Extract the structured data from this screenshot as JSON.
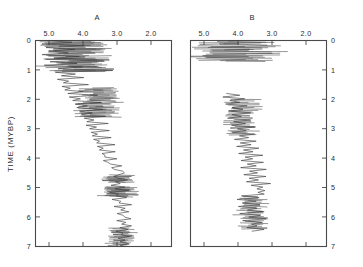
{
  "figure": {
    "background": "#ffffff",
    "ink_color": "#3a3a3a",
    "axis_color": "#4a4a4a"
  },
  "axis": {
    "y_title": "TIME (MYBP)",
    "y_ticks": [
      "0",
      "1",
      "2",
      "3",
      "4",
      "5",
      "6",
      "7"
    ],
    "y_values": [
      0,
      1,
      2,
      3,
      4,
      5,
      6,
      7
    ],
    "x_ticks": [
      "5.0",
      "4.0",
      "3.0",
      "2.0"
    ],
    "x_values": [
      5.0,
      4.0,
      3.0,
      2.0
    ]
  },
  "panels": [
    {
      "id": "A",
      "title": "A",
      "y_axis_side": "left"
    },
    {
      "id": "B",
      "title": "B",
      "y_axis_side": "right"
    }
  ],
  "chart_data": {
    "type": "line",
    "title": "",
    "xlabel": "",
    "ylabel": "TIME (MYBP)",
    "xlim": [
      5.3,
      1.75
    ],
    "ylim": [
      0,
      7
    ],
    "x_tick_labels": [
      "5.0",
      "4.0",
      "3.0",
      "2.0"
    ],
    "x_tick_values": [
      5.0,
      4.0,
      3.0,
      2.0
    ],
    "y_tick_labels": [
      "0",
      "1",
      "2",
      "3",
      "4",
      "5",
      "6",
      "7"
    ],
    "y_tick_values": [
      0,
      1,
      2,
      3,
      4,
      5,
      6,
      7
    ],
    "x_axis_position": "top",
    "x_axis_direction": "reversed",
    "grid": false,
    "legend": "none",
    "series": [
      {
        "name": "A",
        "panel": "A",
        "orientation": "vertical",
        "y_label": "TIME (MYBP)",
        "x_label": "value",
        "description": "High-frequency oscillating trace spanning 0 to 7 MYBP; noisy band near 4.6-5.1 at top, drifting toward 3.0-3.3 by 3.5-7 MYBP.",
        "y": [
          0.0,
          0.06,
          0.12,
          0.18,
          0.24,
          0.3,
          0.36,
          0.42,
          0.48,
          0.54,
          0.6,
          0.66,
          0.72,
          0.78,
          0.84,
          0.9,
          0.96,
          1.02,
          1.08,
          1.14,
          1.2,
          1.26,
          1.32,
          1.38,
          1.44,
          1.5,
          1.56,
          1.62,
          1.68,
          1.74,
          1.8,
          1.86,
          1.92,
          1.98,
          2.04,
          2.1,
          2.16,
          2.22,
          2.28,
          2.34,
          2.4,
          2.46,
          2.52,
          2.58,
          2.64,
          2.7,
          2.76,
          2.82,
          2.88,
          2.94,
          3.0,
          3.06,
          3.12,
          3.18,
          3.24,
          3.3,
          3.36,
          3.42,
          3.48,
          3.54,
          3.6,
          3.66,
          3.72,
          3.78,
          3.84,
          3.9,
          3.96,
          4.02,
          4.08,
          4.14,
          4.2,
          4.26,
          4.32,
          4.38,
          4.44,
          4.5,
          4.56,
          4.62,
          4.68,
          4.74,
          4.8,
          4.86,
          4.92,
          4.98,
          5.04,
          5.1,
          5.16,
          5.22,
          5.28,
          5.34,
          5.4,
          5.46,
          5.52,
          5.58,
          5.64,
          5.7,
          5.76,
          5.82,
          5.88,
          5.94,
          6.0,
          6.06,
          6.12,
          6.18,
          6.24,
          6.3,
          6.36,
          6.42,
          6.48,
          6.54,
          6.6,
          6.66,
          6.72,
          6.78,
          6.84,
          6.9,
          6.96,
          7.0
        ],
        "x": [
          5.05,
          4.35,
          5.1,
          4.05,
          5.0,
          4.25,
          4.95,
          4.45,
          5.15,
          4.15,
          4.85,
          3.35,
          4.9,
          4.2,
          5.05,
          4.1,
          4.7,
          3.25,
          4.8,
          4.3,
          4.65,
          4.0,
          4.75,
          4.4,
          4.55,
          3.95,
          4.6,
          4.35,
          4.5,
          4.05,
          4.45,
          3.7,
          4.4,
          4.1,
          4.3,
          3.6,
          4.25,
          3.95,
          4.2,
          3.5,
          4.15,
          3.85,
          4.1,
          3.45,
          4.05,
          3.75,
          4.0,
          3.4,
          3.95,
          3.7,
          3.9,
          3.35,
          3.85,
          3.65,
          3.8,
          3.3,
          3.75,
          3.6,
          3.7,
          3.25,
          3.65,
          3.55,
          3.6,
          3.2,
          3.55,
          3.5,
          3.52,
          3.15,
          3.5,
          3.45,
          3.3,
          3.05,
          3.35,
          3.2,
          3.05,
          2.95,
          3.1,
          3.25,
          3.15,
          2.9,
          3.2,
          3.05,
          3.3,
          3.0,
          3.25,
          2.85,
          3.35,
          3.1,
          3.2,
          2.95,
          3.3,
          3.05,
          3.15,
          2.8,
          3.25,
          3.0,
          3.1,
          2.9,
          3.2,
          3.05,
          3.0,
          2.85,
          3.15,
          2.95,
          3.05,
          2.8,
          3.1,
          2.9,
          3.2,
          3.0,
          3.05,
          2.85,
          3.15,
          2.95,
          3.1,
          2.9,
          3.05,
          3.0
        ]
      },
      {
        "name": "B-upper",
        "panel": "B",
        "orientation": "vertical",
        "description": "Dense near-horizontal hatched band between 0.0 and 0.7 MYBP spanning roughly 5.2 to 3.1.",
        "y_range": [
          0.0,
          0.7
        ],
        "x_range": [
          5.2,
          3.05
        ]
      },
      {
        "name": "B-lower",
        "panel": "B",
        "orientation": "vertical",
        "description": "Oscillating trace from about 1.8 to 6.5 MYBP centred near 4.0 drifting toward 3.4.",
        "y": [
          1.8,
          1.86,
          1.92,
          1.98,
          2.04,
          2.1,
          2.16,
          2.22,
          2.28,
          2.34,
          2.4,
          2.46,
          2.52,
          2.58,
          2.64,
          2.7,
          2.76,
          2.82,
          2.88,
          2.94,
          3.0,
          3.06,
          3.12,
          3.18,
          3.24,
          3.3,
          3.36,
          3.42,
          3.48,
          3.54,
          3.6,
          3.66,
          3.72,
          3.78,
          3.84,
          3.9,
          3.96,
          4.02,
          4.08,
          4.14,
          4.2,
          4.26,
          4.32,
          4.38,
          4.44,
          4.5,
          4.56,
          4.62,
          4.68,
          4.74,
          4.8,
          4.86,
          4.92,
          4.98,
          5.04,
          5.1,
          5.16,
          5.22,
          5.28,
          5.34,
          5.4,
          5.46,
          5.52,
          5.58,
          5.64,
          5.7,
          5.76,
          5.82,
          5.88,
          5.94,
          6.0,
          6.06,
          6.12,
          6.18,
          6.24,
          6.3,
          6.36,
          6.42,
          6.48
        ],
        "x": [
          4.35,
          4.0,
          4.45,
          3.85,
          4.3,
          4.05,
          4.4,
          3.8,
          4.25,
          3.95,
          4.35,
          3.75,
          4.2,
          4.0,
          4.3,
          3.7,
          4.15,
          3.9,
          4.25,
          3.65,
          4.1,
          3.85,
          4.2,
          3.6,
          4.05,
          3.8,
          4.15,
          3.55,
          4.0,
          3.75,
          4.1,
          3.5,
          3.95,
          3.7,
          4.05,
          3.45,
          3.9,
          3.65,
          4.0,
          3.4,
          3.85,
          3.6,
          3.95,
          3.35,
          3.8,
          3.55,
          3.9,
          3.3,
          3.75,
          3.5,
          3.85,
          3.25,
          3.7,
          3.45,
          3.6,
          3.4,
          3.55,
          3.35,
          3.95,
          3.5,
          4.1,
          3.6,
          3.95,
          3.45,
          4.05,
          3.55,
          3.85,
          3.4,
          4.0,
          3.5,
          3.8,
          3.35,
          3.95,
          3.45,
          3.75,
          3.55,
          3.85,
          3.4,
          3.65
        ]
      }
    ]
  }
}
